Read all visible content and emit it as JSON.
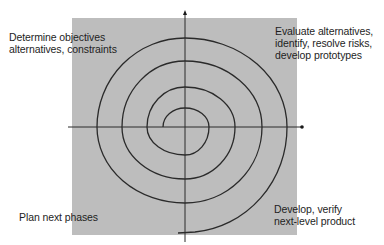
{
  "diagram": {
    "type": "spiral-model",
    "colors": {
      "quadrant_background": "#bdbdbd",
      "line": "#2a2a2a",
      "page_background": "#ffffff"
    },
    "quadrants": {
      "top_left": {
        "lines": [
          "Determine objectives",
          "alternatives, constraints"
        ]
      },
      "top_right": {
        "lines": [
          "Evaluate alternatives,",
          "identify, resolve risks,",
          "develop prototypes"
        ]
      },
      "bottom_left": {
        "lines": [
          "Plan next phases"
        ]
      },
      "bottom_right": {
        "lines": [
          "Develop, verify",
          "next-level product"
        ]
      }
    },
    "axes": {
      "vertical": "arrow pointing up",
      "horizontal": "arrow pointing right"
    },
    "spiral": {
      "turns": 4,
      "direction": "outward, clockwise"
    }
  }
}
